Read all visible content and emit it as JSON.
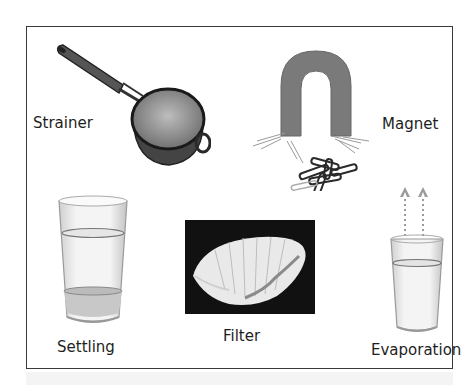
{
  "figure": {
    "items": [
      {
        "id": "strainer",
        "label": "Strainer",
        "icon": "strainer-icon"
      },
      {
        "id": "magnet",
        "label": "Magnet",
        "icon": "horseshoe-magnet-icon"
      },
      {
        "id": "settling",
        "label": "Settling",
        "icon": "glass-with-sediment-icon"
      },
      {
        "id": "filter",
        "label": "Filter",
        "icon": "coffee-filter-icon"
      },
      {
        "id": "evaporation",
        "label": "Evaporation",
        "icon": "glass-with-vapor-arrows-icon"
      }
    ]
  },
  "colors": {
    "border": "#3a3a3a",
    "magnet": "#7a7a7a",
    "filter_bg": "#111111",
    "text": "#1e1e1e"
  }
}
